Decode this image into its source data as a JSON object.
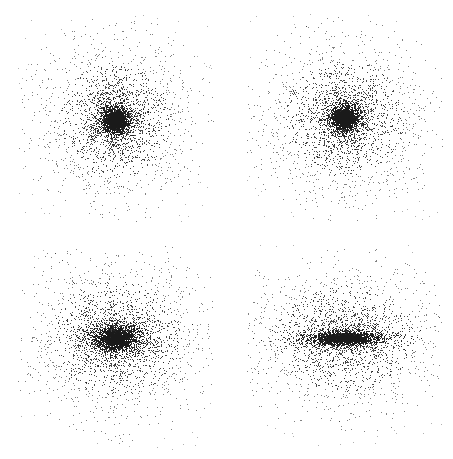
{
  "figure": {
    "title": "",
    "width": 453,
    "height": 459,
    "background_color": "#ffffff",
    "point_color": "#1a1a1a",
    "layout": "2x2 grid of scatter panels",
    "caption": ""
  },
  "chart_data": {
    "type": "scatter",
    "title": "",
    "subtitle": "",
    "xlabel": "",
    "ylabel": "",
    "grid": false,
    "legend_position": "none",
    "axes_visible": false,
    "tick_labels": [],
    "panel_count": 4,
    "points_per_panel": 4000,
    "marker": {
      "shape": "square",
      "size_px": 1,
      "color": "#1a1a1a",
      "opacity": 0.85
    },
    "panels": [
      {
        "id": "panel-top-left",
        "index": 0,
        "row": 0,
        "col": 0,
        "label": "",
        "x_px": 18,
        "y_px": 14,
        "width_px": 196,
        "height_px": 208,
        "center_x_px": 115,
        "center_y_px": 120,
        "n_points": 4200,
        "core_scale_x": 11,
        "core_scale_y": 11,
        "halo_scale_x": 46,
        "halo_scale_y": 48,
        "axis_ratio_ba": 1.0,
        "flattening": 0.0,
        "description": "nearly spherical dense concentration with extended round halo",
        "xlim": [
          -1,
          1
        ],
        "ylim": [
          -1,
          1
        ]
      },
      {
        "id": "panel-top-right",
        "index": 1,
        "row": 0,
        "col": 1,
        "label": "",
        "x_px": 247,
        "y_px": 14,
        "width_px": 196,
        "height_px": 208,
        "center_x_px": 344,
        "center_y_px": 118,
        "n_points": 4200,
        "core_scale_x": 12,
        "core_scale_y": 11,
        "halo_scale_x": 50,
        "halo_scale_y": 48,
        "axis_ratio_ba": 0.95,
        "flattening": 0.05,
        "description": "nearly spherical, slightly looser core than panel 1",
        "xlim": [
          -1,
          1
        ],
        "ylim": [
          -1,
          1
        ]
      },
      {
        "id": "panel-bottom-left",
        "index": 2,
        "row": 1,
        "col": 0,
        "label": "",
        "x_px": 18,
        "y_px": 245,
        "width_px": 196,
        "height_px": 205,
        "center_x_px": 116,
        "center_y_px": 338,
        "n_points": 4200,
        "core_scale_x": 20,
        "core_scale_y": 12,
        "halo_scale_x": 54,
        "halo_scale_y": 48,
        "axis_ratio_ba": 0.6,
        "flattening": 0.4,
        "description": "mildly flattened oblate distribution elongated horizontally",
        "xlim": [
          -1,
          1
        ],
        "ylim": [
          -1,
          1
        ]
      },
      {
        "id": "panel-bottom-right",
        "index": 3,
        "row": 1,
        "col": 1,
        "label": "",
        "x_px": 247,
        "y_px": 245,
        "width_px": 196,
        "height_px": 205,
        "center_x_px": 344,
        "center_y_px": 338,
        "n_points": 4200,
        "core_scale_x": 30,
        "core_scale_y": 6,
        "halo_scale_x": 58,
        "halo_scale_y": 44,
        "axis_ratio_ba": 0.2,
        "flattening": 0.8,
        "description": "strongly flattened edge-on disk with thin dark midplane bar and diffuse halo",
        "xlim": [
          -1,
          1
        ],
        "ylim": [
          -1,
          1
        ]
      }
    ]
  }
}
